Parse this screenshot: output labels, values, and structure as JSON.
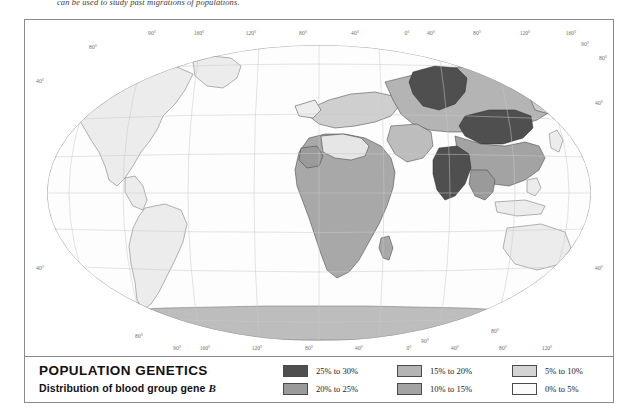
{
  "caption": {
    "text": "can be used to study past migrations of populations."
  },
  "legend": {
    "title": "POPULATION GENETICS",
    "subtitle_before": "Distribution of blood group gene ",
    "subtitle_gene": "B",
    "columns": [
      {
        "entries": [
          {
            "label": "25% to 30%",
            "color": "#4f4f4f"
          },
          {
            "label": "20% to 25%",
            "color": "#9a9a9a"
          }
        ]
      },
      {
        "entries": [
          {
            "label": "15% to 20%",
            "color": "#b4b4b4"
          },
          {
            "label": "10% to 15%",
            "color": "#a3a3a3"
          }
        ]
      },
      {
        "entries": [
          {
            "label": "5% to 10%",
            "color": "#d4d4d4"
          },
          {
            "label": "0% to 5%",
            "color": "#f4f4f4"
          }
        ]
      }
    ]
  },
  "map": {
    "projection": "oval world projection",
    "colors": {
      "ocean": "#ffffff",
      "land_base": "#e9e9e9",
      "class_0_5": "#f4f4f4",
      "class_5_10": "#d4d4d4",
      "class_10_15": "#a3a3a3",
      "class_15_20": "#b4b4b4",
      "class_20_25": "#9a9a9a",
      "class_25_30": "#4f4f4f",
      "antarctica": "#bdbdbd",
      "graticule": "#bfbfbf",
      "coastline": "#5a5a5a",
      "border": "#3a3a3a"
    },
    "longitude_labels_top": [
      "160°",
      "120°",
      "80°",
      "40°",
      "0°",
      "40°",
      "80°",
      "120°",
      "160°"
    ],
    "longitude_labels_bottom": [
      "160°",
      "120°",
      "80°",
      "40°",
      "0°",
      "40°",
      "80°",
      "120°",
      "160°"
    ],
    "pole_labels_top": [
      "90°",
      "80°",
      "90°",
      "80°"
    ],
    "pole_labels_bottom": [
      "80°",
      "90°",
      "90°",
      "80°"
    ],
    "latitude_labels_left": [
      "40°",
      "40°"
    ],
    "latitude_labels_right": [
      "40°",
      "40°"
    ]
  }
}
